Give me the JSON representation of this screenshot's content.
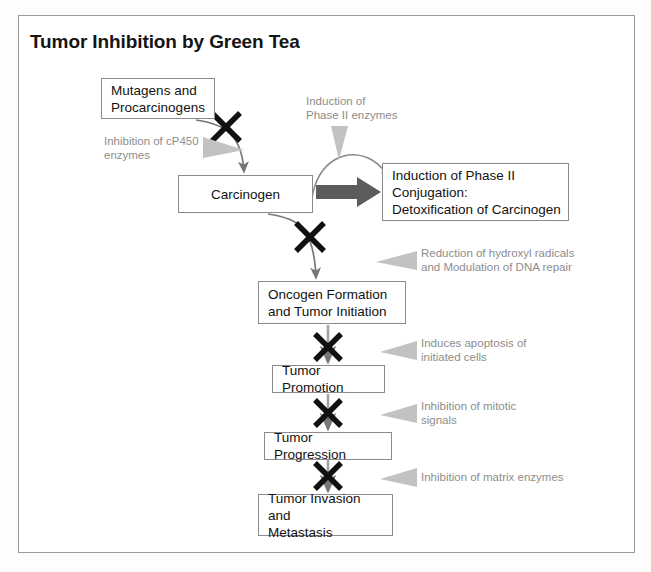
{
  "figure": {
    "title": "Tumor Inhibition by Green Tea",
    "frame_color": "#9a9a9a",
    "box_border_color": "#8b8b8b",
    "arrow_color": "#6e6e6e",
    "block_arrow_color": "#5c5c5c",
    "annotation_color": "#8d8d8d",
    "annotation_arrow_color": "#bdbdbd",
    "x_mark_color": "#111111",
    "text_color": "#121212"
  },
  "nodes": [
    {
      "id": "mutagens",
      "label": "Mutagens and\nProcarcinogens",
      "x": 101,
      "y": 78,
      "w": 114,
      "h": 41,
      "align": "center"
    },
    {
      "id": "carcinogen",
      "label": "Carcinogen",
      "x": 178,
      "y": 175,
      "w": 135,
      "h": 38,
      "align": "center"
    },
    {
      "id": "phase2",
      "label": "Induction of Phase II\nConjugation:\nDetoxification of Carcinogen",
      "x": 382,
      "y": 163,
      "w": 187,
      "h": 58,
      "align": "left"
    },
    {
      "id": "oncogen",
      "label": "Oncogen Formation\nand Tumor Initiation",
      "x": 258,
      "y": 281,
      "w": 148,
      "h": 43,
      "align": "left"
    },
    {
      "id": "promotion",
      "label": "Tumor Promotion",
      "x": 272,
      "y": 365,
      "w": 113,
      "h": 28,
      "align": "left"
    },
    {
      "id": "progression",
      "label": "Tumor Progression",
      "x": 264,
      "y": 432,
      "w": 128,
      "h": 28,
      "align": "left"
    },
    {
      "id": "invasion",
      "label": "Tumor Invasion and\nMetastasis",
      "x": 258,
      "y": 494,
      "w": 135,
      "h": 42,
      "align": "left"
    }
  ],
  "annotations": [
    {
      "id": "cp450",
      "label": "Inhibition of cP450\nenzymes",
      "x": 104,
      "y": 134,
      "arrow_x": 203,
      "arrow_y": 145,
      "arrow_dir": "right"
    },
    {
      "id": "phase2enz",
      "label": "Induction of\nPhase II enzymes",
      "x": 306,
      "y": 94,
      "arrow_x": 339,
      "arrow_y": 128,
      "arrow_dir": "down"
    },
    {
      "id": "hydroxyl",
      "label": "Reduction of hydroxyl radicals\nand Modulation of DNA repair",
      "x": 421,
      "y": 246,
      "arrow_x": 394,
      "arrow_y": 257,
      "arrow_dir": "left"
    },
    {
      "id": "apoptosis",
      "label": "Induces apoptosis of\ninitiated cells",
      "x": 421,
      "y": 336,
      "arrow_x": 394,
      "arrow_y": 347,
      "arrow_dir": "left"
    },
    {
      "id": "mitotic",
      "label": "Inhibition of mitotic\nsignals",
      "x": 421,
      "y": 399,
      "arrow_x": 394,
      "arrow_y": 410,
      "arrow_dir": "left"
    },
    {
      "id": "matrix",
      "label": "Inhibition of matrix enzymes",
      "x": 421,
      "y": 470,
      "arrow_x": 394,
      "arrow_y": 474,
      "arrow_dir": "left"
    }
  ],
  "flow": {
    "inhibition_marks": 5,
    "block_arrow_label": "carcinogen-to-phase2-block-arrow",
    "curve_label": "carcinogen-detox-curve"
  }
}
